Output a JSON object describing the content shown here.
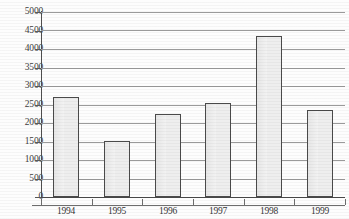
{
  "chart_data": {
    "type": "bar",
    "title": "",
    "subtitle": "",
    "xlabel": "",
    "ylabel": "",
    "categories": [
      "1994",
      "1995",
      "1996",
      "1997",
      "1998",
      "1999"
    ],
    "values": [
      2690,
      1520,
      2250,
      2550,
      4350,
      2350
    ],
    "series": [
      {
        "name": "",
        "values": [
          2690,
          1520,
          2250,
          2550,
          4350,
          2350
        ]
      }
    ],
    "ylim": [
      0,
      5000
    ],
    "ytick_labels": [
      "0",
      "500",
      "1000",
      "1500",
      "2000",
      "2500",
      "3000",
      "3500",
      "4000",
      "4500",
      "5000"
    ],
    "ytick_values": [
      0,
      500,
      1000,
      1500,
      2000,
      2500,
      3000,
      3500,
      4000,
      4500,
      5000
    ],
    "ytick_step": 500,
    "grid": true,
    "grid_axis": "y",
    "legend": false,
    "legend_position": "none",
    "bar_fill_color": "#eeeeee",
    "bar_border_color": "#4a4a4a",
    "gridline_color": "#9a9a9a",
    "axis_color": "#4e4e4e",
    "text_color": "#3d3d3d",
    "background_color": "#fdfdfd"
  }
}
